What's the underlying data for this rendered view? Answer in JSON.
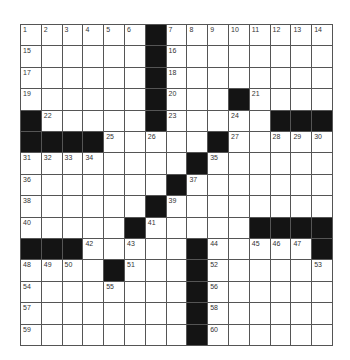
{
  "puzzle": {
    "rows": 15,
    "cols": 15,
    "grid": [
      [
        1,
        2,
        3,
        4,
        5,
        6,
        "#",
        7,
        8,
        9,
        10,
        11,
        12,
        13,
        14
      ],
      [
        15,
        0,
        0,
        0,
        0,
        0,
        "#",
        16,
        0,
        0,
        0,
        0,
        0,
        0,
        0
      ],
      [
        17,
        0,
        0,
        0,
        0,
        0,
        "#",
        18,
        0,
        0,
        0,
        0,
        0,
        0,
        0
      ],
      [
        19,
        0,
        0,
        0,
        0,
        0,
        "#",
        20,
        0,
        0,
        "#",
        21,
        0,
        0,
        0
      ],
      [
        "#",
        22,
        0,
        0,
        0,
        0,
        "#",
        23,
        0,
        0,
        24,
        0,
        "#",
        "#",
        "#"
      ],
      [
        "#",
        "#",
        "#",
        "#",
        25,
        0,
        26,
        0,
        0,
        "#",
        27,
        0,
        28,
        29,
        30
      ],
      [
        31,
        32,
        33,
        34,
        0,
        0,
        0,
        0,
        "#",
        35,
        0,
        0,
        0,
        0,
        0
      ],
      [
        36,
        0,
        0,
        0,
        0,
        0,
        0,
        "#",
        37,
        0,
        0,
        0,
        0,
        0,
        0
      ],
      [
        38,
        0,
        0,
        0,
        0,
        0,
        "#",
        39,
        0,
        0,
        0,
        0,
        0,
        0,
        0
      ],
      [
        40,
        0,
        0,
        0,
        0,
        "#",
        41,
        0,
        0,
        0,
        0,
        "#",
        "#",
        "#",
        "#"
      ],
      [
        "#",
        "#",
        "#",
        42,
        0,
        43,
        0,
        0,
        "#",
        44,
        0,
        45,
        46,
        47,
        "#"
      ],
      [
        48,
        49,
        50,
        0,
        "#",
        51,
        0,
        0,
        "#",
        52,
        0,
        0,
        0,
        0,
        53
      ],
      [
        54,
        0,
        0,
        0,
        55,
        0,
        0,
        0,
        "#",
        56,
        0,
        0,
        0,
        0,
        0
      ],
      [
        57,
        0,
        0,
        0,
        0,
        0,
        0,
        0,
        "#",
        58,
        0,
        0,
        0,
        0,
        0
      ],
      [
        59,
        0,
        0,
        0,
        0,
        0,
        0,
        0,
        "#",
        60,
        0,
        0,
        0,
        0,
        0
      ]
    ],
    "colors": {
      "block": "#141414",
      "cell": "#ffffff",
      "line": "#555555"
    }
  }
}
